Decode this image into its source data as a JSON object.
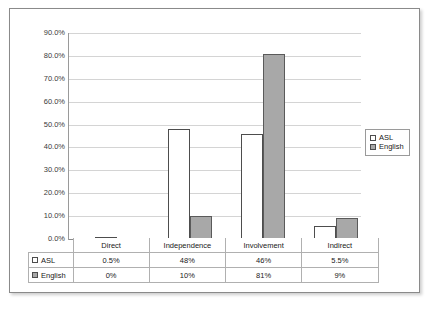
{
  "chart_data": {
    "type": "bar",
    "title": "",
    "xlabel": "",
    "ylabel": "",
    "categories": [
      "Direct",
      "Independence",
      "Involvement",
      "Indirect"
    ],
    "series": [
      {
        "name": "ASL",
        "values": [
          0.5,
          48,
          46,
          5.5
        ],
        "labels": [
          "0.5%",
          "48%",
          "46%",
          "5.5%"
        ],
        "color": "#ffffff"
      },
      {
        "name": "English",
        "values": [
          0,
          10,
          81,
          9
        ],
        "labels": [
          "0%",
          "10%",
          "81%",
          "9%"
        ],
        "color": "#a8a8a8"
      }
    ],
    "ylim": [
      0,
      90
    ],
    "ytick_labels": [
      "90.0%",
      "80.0%",
      "70.0%",
      "60.0%",
      "50.0%",
      "40.0%",
      "30.0%",
      "20.0%",
      "10.0%",
      "0.0%"
    ],
    "ytick_values": [
      90,
      80,
      70,
      60,
      50,
      40,
      30,
      20,
      10,
      0
    ],
    "grid": true,
    "legend_position": "right",
    "data_table_visible": true
  },
  "legend": {
    "items": [
      {
        "label": "ASL",
        "swatch": "white-square-swatch"
      },
      {
        "label": "English",
        "swatch": "gray-square-swatch"
      }
    ]
  },
  "table": {
    "columns": [
      "Direct",
      "Independence",
      "Involvement",
      "Indirect"
    ],
    "rows": [
      {
        "key": "ASL",
        "values": [
          "0.5%",
          "48%",
          "46%",
          "5.5%"
        ]
      },
      {
        "key": "English",
        "values": [
          "0%",
          "10%",
          "81%",
          "9%"
        ]
      }
    ]
  },
  "colors": {
    "asl_bar": "#ffffff",
    "english_bar": "#a8a8a8",
    "bar_outline": "#4d4d4d",
    "gridline": "#d4d4d4",
    "frame_border": "#8a8a8a"
  }
}
